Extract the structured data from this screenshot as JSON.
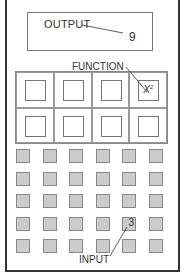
{
  "output": {
    "label": "OUTPUT",
    "value": "9"
  },
  "function": {
    "label": "FUNCTION",
    "cells": [
      {
        "text": ""
      },
      {
        "text": ""
      },
      {
        "text": ""
      },
      {
        "text": "X",
        "sup": "2"
      },
      {
        "text": ""
      },
      {
        "text": ""
      },
      {
        "text": ""
      },
      {
        "text": ""
      }
    ]
  },
  "input": {
    "label": "INPUT",
    "rows": 5,
    "cols": 6,
    "highlighted": {
      "row": 3,
      "col": 4,
      "value": "3"
    }
  },
  "colors": {
    "square_fill": "#cccccc",
    "line": "#333333"
  }
}
